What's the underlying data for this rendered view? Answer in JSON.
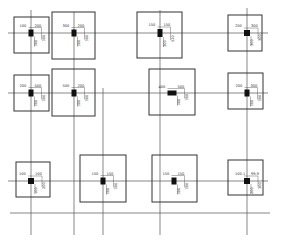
{
  "drawing": {
    "type": "foundation-plan",
    "vertical_axes_x": [
      31,
      74,
      103,
      160,
      247
    ],
    "horizontal_axes_y": [
      33,
      93,
      181,
      213
    ],
    "footings": [
      {
        "id": "A1",
        "x": 14,
        "y": 17,
        "w": 35,
        "h": 36,
        "cx": 31,
        "cy": 33,
        "col_w": 5,
        "col_h": 7,
        "labels": [
          "100",
          "200",
          "300",
          "300"
        ]
      },
      {
        "id": "A2",
        "x": 52,
        "y": 12,
        "w": 43,
        "h": 47,
        "cx": 74,
        "cy": 33,
        "col_w": 5,
        "col_h": 7,
        "labels": [
          "300",
          "200",
          "300",
          "300"
        ]
      },
      {
        "id": "A3",
        "x": 137,
        "y": 12,
        "w": 45,
        "h": 46,
        "cx": 160,
        "cy": 33,
        "col_w": 5,
        "col_h": 8,
        "labels": [
          "150",
          "150",
          "300",
          "520"
        ]
      },
      {
        "id": "A4",
        "x": 228,
        "y": 15,
        "w": 34,
        "h": 36,
        "cx": 247,
        "cy": 33,
        "col_w": 6,
        "col_h": 6,
        "labels": [
          "200",
          "300",
          "300",
          "300"
        ]
      },
      {
        "id": "B1",
        "x": 14,
        "y": 75,
        "w": 35,
        "h": 36,
        "cx": 31,
        "cy": 93,
        "col_w": 5,
        "col_h": 7,
        "labels": [
          "200",
          "500",
          "300",
          "300"
        ]
      },
      {
        "id": "B2",
        "x": 52,
        "y": 69,
        "w": 43,
        "h": 47,
        "cx": 74,
        "cy": 93,
        "col_w": 5,
        "col_h": 7,
        "labels": [
          "500",
          "200",
          "300",
          "300"
        ]
      },
      {
        "id": "B3",
        "x": 149,
        "y": 69,
        "w": 46,
        "h": 46,
        "cx": 172,
        "cy": 93,
        "col_w": 9,
        "col_h": 5,
        "labels": [
          "400",
          "500",
          "300",
          "300"
        ]
      },
      {
        "id": "B4",
        "x": 228,
        "y": 73,
        "w": 35,
        "h": 36,
        "cx": 247,
        "cy": 93,
        "col_w": 5,
        "col_h": 7,
        "labels": [
          "200",
          "300",
          "300",
          "300"
        ]
      },
      {
        "id": "C1",
        "x": 16,
        "y": 162,
        "w": 34,
        "h": 35,
        "cx": 31,
        "cy": 181,
        "col_w": 6,
        "col_h": 6,
        "labels": [
          "100",
          "100",
          "100",
          "200"
        ]
      },
      {
        "id": "C2",
        "x": 80,
        "y": 155,
        "w": 46,
        "h": 47,
        "cx": 103,
        "cy": 181,
        "col_w": 5,
        "col_h": 7,
        "labels": [
          "150",
          "150",
          "300",
          "300"
        ]
      },
      {
        "id": "C3",
        "x": 152,
        "y": 155,
        "w": 45,
        "h": 47,
        "cx": 174,
        "cy": 181,
        "col_w": 5,
        "col_h": 7,
        "labels": [
          "150",
          "150",
          "300",
          "300"
        ]
      },
      {
        "id": "C4",
        "x": 228,
        "y": 160,
        "w": 35,
        "h": 35,
        "cx": 247,
        "cy": 181,
        "col_w": 6,
        "col_h": 6,
        "labels": [
          "100.1",
          "99.9",
          "200",
          "300"
        ]
      }
    ]
  }
}
